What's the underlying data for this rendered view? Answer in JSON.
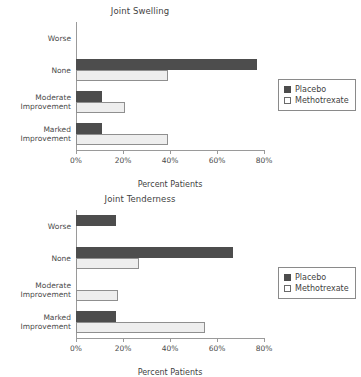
{
  "charts": [
    {
      "title": "Joint Swelling",
      "xlabel": "Percent Patients",
      "legend": {
        "placebo": "Placebo",
        "methotrexate": "Methotrexate"
      },
      "ticks": [
        "0%",
        "20%",
        "40%",
        "60%",
        "80%"
      ],
      "categories": [
        {
          "line1": "Worse",
          "line2": ""
        },
        {
          "line1": "None",
          "line2": ""
        },
        {
          "line1": "Moderate",
          "line2": "Improvement"
        },
        {
          "line1": "Marked",
          "line2": "Improvement"
        }
      ]
    },
    {
      "title": "Joint Tenderness",
      "xlabel": "Percent Patients",
      "legend": {
        "placebo": "Placebo",
        "methotrexate": "Methotrexate"
      },
      "ticks": [
        "0%",
        "20%",
        "40%",
        "60%",
        "80%"
      ],
      "categories": [
        {
          "line1": "Worse",
          "line2": ""
        },
        {
          "line1": "None",
          "line2": ""
        },
        {
          "line1": "Moderate",
          "line2": "Improvement"
        },
        {
          "line1": "Marked",
          "line2": "Improvement"
        }
      ]
    }
  ],
  "chart_data": [
    {
      "type": "bar",
      "orientation": "horizontal",
      "title": "Joint Swelling",
      "xlabel": "Percent Patients",
      "ylabel": "",
      "xlim": [
        0,
        80
      ],
      "xticks": [
        0,
        20,
        40,
        60,
        80
      ],
      "xtick_labels": [
        "0%",
        "20%",
        "40%",
        "60%",
        "80%"
      ],
      "grid": false,
      "legend_position": "right",
      "categories": [
        "Worse",
        "None",
        "Moderate Improvement",
        "Marked Improvement"
      ],
      "series": [
        {
          "name": "Placebo",
          "color": "#4d4d4d",
          "values": [
            0,
            77,
            11,
            11
          ]
        },
        {
          "name": "Methotrexate",
          "color": "#eeeeee",
          "values": [
            0,
            39,
            21,
            39
          ]
        }
      ]
    },
    {
      "type": "bar",
      "orientation": "horizontal",
      "title": "Joint Tenderness",
      "xlabel": "Percent Patients",
      "ylabel": "",
      "xlim": [
        0,
        80
      ],
      "xticks": [
        0,
        20,
        40,
        60,
        80
      ],
      "xtick_labels": [
        "0%",
        "20%",
        "40%",
        "60%",
        "80%"
      ],
      "grid": false,
      "legend_position": "right",
      "categories": [
        "Worse",
        "None",
        "Moderate Improvement",
        "Marked Improvement"
      ],
      "series": [
        {
          "name": "Placebo",
          "color": "#4d4d4d",
          "values": [
            17,
            67,
            0,
            17
          ]
        },
        {
          "name": "Methotrexate",
          "color": "#eeeeee",
          "values": [
            0,
            27,
            18,
            55
          ]
        }
      ]
    }
  ]
}
